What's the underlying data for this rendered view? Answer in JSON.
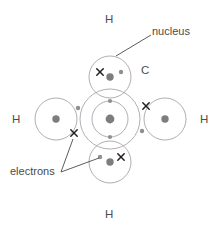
{
  "figure": {
    "molecule": "CH4",
    "background_color": "#ffffff",
    "shell_stroke_color": "#a9a4ad",
    "nucleus_fill_color": "#7d7d7d",
    "carbon_electron_color": "#8f8f8f",
    "hydrogen_electron_color": "#231f20",
    "label_color": "#4a4a4a",
    "leader_line_color": "#4a4a4a"
  },
  "atom_labels": {
    "carbon": "C",
    "hydrogen_top": "H",
    "hydrogen_left": "H",
    "hydrogen_right": "H",
    "hydrogen_bottom": "H"
  },
  "callouts": {
    "nucleus": "nucleus",
    "electrons": "electrons"
  },
  "structure": {
    "carbon": {
      "label": "C",
      "center": [
        110,
        119
      ],
      "inner_shell_radius": 18,
      "outer_shell_radius": 30,
      "nucleus_radius": 4.2,
      "inner_shell_electron_count": 4,
      "outer_shell_electron_count": 4
    },
    "hydrogens": [
      {
        "label": "H",
        "position": "top",
        "center": [
          110,
          77
        ],
        "shell_radius": 21,
        "nucleus_radius": 3.6,
        "bond_dot": [
          121,
          72
        ],
        "bond_cross": [
          100,
          72
        ]
      },
      {
        "label": "H",
        "position": "left",
        "center": [
          56,
          119
        ],
        "shell_radius": 21,
        "nucleus_radius": 3.6,
        "bond_dot": [
          78,
          108
        ],
        "bond_cross": [
          74,
          133
        ]
      },
      {
        "label": "H",
        "position": "right",
        "center": [
          165,
          119
        ],
        "shell_radius": 21,
        "nucleus_radius": 3.6,
        "bond_dot": [
          142,
          131
        ],
        "bond_cross": [
          146,
          106
        ]
      },
      {
        "label": "H",
        "position": "bottom",
        "center": [
          110,
          162
        ],
        "shell_radius": 21,
        "nucleus_radius": 3.6,
        "bond_dot": [
          100,
          157
        ],
        "bond_cross": [
          121,
          157
        ]
      }
    ]
  },
  "nucleus_callout_line": {
    "from": [
      117,
      55
    ],
    "to": [
      151,
      35
    ]
  },
  "electrons_callout_lines": [
    {
      "from": [
        61,
        172
      ],
      "to": [
        72,
        140
      ]
    },
    {
      "from": [
        61,
        172
      ],
      "to": [
        99,
        157
      ]
    }
  ]
}
